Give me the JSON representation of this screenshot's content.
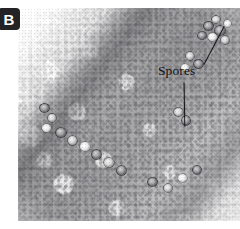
{
  "figure": {
    "panel_label": "B",
    "panel_label_name": "panel-letter-badge",
    "caption_visible": false,
    "image_type": "light micrograph",
    "color_mode": "grayscale",
    "background_color": "#ffffff",
    "tissue_dark_color": "#54545a",
    "tissue_light_color": "#f2f2f2",
    "annotation_color": "#101014",
    "badge_color": "#232326",
    "badge_text_color": "#ffffff"
  },
  "annotations": [
    {
      "id": "spores-label",
      "text": "Spores",
      "x": 158,
      "y": 64,
      "leader_lines": [
        {
          "id": "leader-upper-right",
          "from_x": 204,
          "from_y": 64,
          "to_x": 224,
          "to_y": 26
        },
        {
          "id": "leader-lower",
          "from_x": 184,
          "from_y": 82,
          "to_x": 183,
          "to_y": 126
        }
      ]
    }
  ],
  "spore_clusters": [
    {
      "id": "upper-right-cluster",
      "count": 7,
      "region": "top-right tissue margin"
    },
    {
      "id": "mid-right-cluster",
      "count": 5,
      "region": "right tissue margin"
    },
    {
      "id": "lower-left-cluster",
      "count": 9,
      "region": "lower-left tissue margin"
    },
    {
      "id": "bottom-right-cluster",
      "count": 4,
      "region": "bottom-right tissue margin"
    }
  ],
  "plate": {
    "left": 18,
    "top": 8,
    "width": 222,
    "height": 213
  }
}
